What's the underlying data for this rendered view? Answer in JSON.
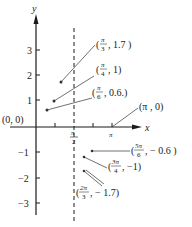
{
  "axes": {
    "x_label": "x",
    "y_label": "y",
    "origin_label": "(0, 0)",
    "y_ticks": [
      "3",
      "2",
      "1",
      "−1",
      "−2",
      "−3"
    ],
    "x_ticks": [
      {
        "num": "π",
        "den": "2"
      },
      {
        "num": "π",
        "den": ""
      }
    ]
  },
  "points": [
    {
      "open": "(",
      "num": "π",
      "den": "3",
      "rest": ", 1.7 )"
    },
    {
      "open": "(",
      "num": "π",
      "den": "4",
      "rest": ", 1)"
    },
    {
      "open": "(",
      "num": "π",
      "den": "6",
      "rest": ", 0.6.)"
    },
    {
      "label": "(π , 0)"
    },
    {
      "open": "(",
      "num": "5π",
      "den": "6",
      "rest": ", − 0.6 )"
    },
    {
      "open": "(",
      "num": "3π",
      "den": "4",
      "rest": ", −1)"
    },
    {
      "open": "(",
      "num": "2π",
      "den": "3",
      "rest": ", − 1.7)"
    }
  ],
  "colors": {
    "ink": "#1a1a1a",
    "background": "#ffffff"
  }
}
